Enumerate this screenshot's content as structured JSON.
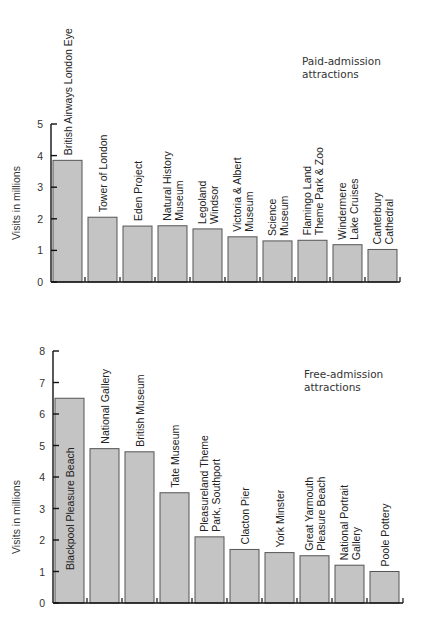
{
  "chart_data": [
    {
      "type": "bar",
      "title": "",
      "annotation": "Paid-admission attractions",
      "xlabel": "",
      "ylabel": "Visits in millions",
      "ylim": [
        0,
        5
      ],
      "yticks": [
        0,
        1,
        2,
        3,
        4,
        5
      ],
      "grid": false,
      "categories": [
        "British Airways London Eye",
        "Tower of London",
        "Eden Project",
        "Natural History Museum",
        "Legoland Windsor",
        "Victoria & Albert Museum",
        "Science Museum",
        "Flamingo Land Theme Park & Zoo",
        "Windermere Lake Cruises",
        "Canterbury Cathedral"
      ],
      "label_lines": [
        [
          "British Airways London Eye"
        ],
        [
          "Tower of London"
        ],
        [
          "Eden Project"
        ],
        [
          "Natural History",
          "Museum"
        ],
        [
          "Legoland",
          "Windsor"
        ],
        [
          "Victoria & Albert",
          "Museum"
        ],
        [
          "Science",
          "Museum"
        ],
        [
          "Flamingo Land",
          "Theme Park & Zoo"
        ],
        [
          "Windermere",
          "Lake Cruises"
        ],
        [
          "Canterbury",
          "Cathedral"
        ]
      ],
      "values": [
        3.85,
        2.05,
        1.77,
        1.78,
        1.68,
        1.43,
        1.3,
        1.32,
        1.18,
        1.03
      ]
    },
    {
      "type": "bar",
      "title": "",
      "annotation": "Free-admission attractions",
      "xlabel": "",
      "ylabel": "Visits in millions",
      "ylim": [
        0,
        8
      ],
      "yticks": [
        0,
        1,
        2,
        3,
        4,
        5,
        6,
        7,
        8
      ],
      "grid": false,
      "categories": [
        "Blackpool Pleasure Beach",
        "National Gallery",
        "British Museum",
        "Tate Museum",
        "Pleasureland Theme Park, Southport",
        "Clacton Pier",
        "York Minster",
        "Great Yarmouth Pleasure Beach",
        "National Portrait Gallery",
        "Poole Pottery"
      ],
      "label_lines": [
        [
          "Blackpool Pleasure Beach"
        ],
        [
          "National Gallery"
        ],
        [
          "British Museum"
        ],
        [
          "Tate Museum"
        ],
        [
          "Pleasureland Theme",
          "Park, Southport"
        ],
        [
          "Clacton Pier"
        ],
        [
          "York Minster"
        ],
        [
          "Great Yarmouth",
          "Pleasure Beach"
        ],
        [
          "National Portrait",
          "Gallery"
        ],
        [
          "Poole Pottery"
        ]
      ],
      "values": [
        6.5,
        4.9,
        4.8,
        3.5,
        2.1,
        1.7,
        1.6,
        1.5,
        1.2,
        1.0
      ]
    }
  ],
  "paid": {
    "annotation_line1": "Paid-admission",
    "annotation_line2": "attractions",
    "ylabel": "Visits in millions"
  },
  "free": {
    "annotation_line1": "Free-admission",
    "annotation_line2": "attractions",
    "ylabel": "Visits in millions"
  }
}
